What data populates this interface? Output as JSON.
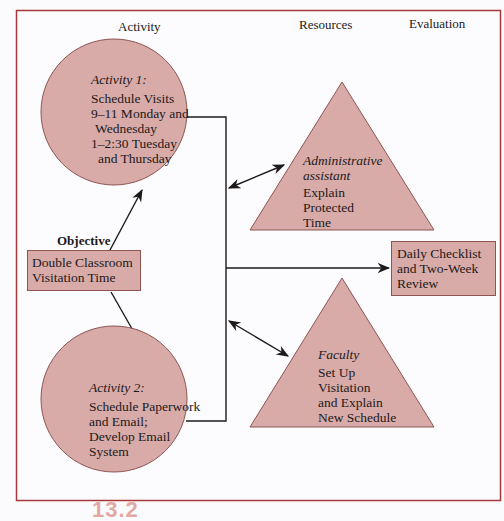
{
  "headers": {
    "activity": "Activity",
    "resources": "Resources",
    "evaluation": "Evaluation"
  },
  "objective": {
    "label": "Objective",
    "text_line1": "Double Classroom",
    "text_line2": "Visitation Time"
  },
  "activity1": {
    "title": "Activity 1:",
    "lines": [
      "Schedule Visits",
      "9–11 Monday and",
      "Wednesday",
      "1–2:30 Tuesday",
      "and Thursday"
    ]
  },
  "activity2": {
    "title": "Activity 2:",
    "lines": [
      "Schedule Paperwork",
      "and Email;",
      "Develop Email",
      "System"
    ]
  },
  "resource1": {
    "title_line1": "Administrative",
    "title_line2": "assistant",
    "lines": [
      "Explain",
      "Protected",
      "Time"
    ]
  },
  "resource2": {
    "title": "Faculty",
    "lines": [
      "Set Up",
      "Visitation",
      "and Explain",
      "New Schedule"
    ]
  },
  "evaluation": {
    "lines": [
      "Daily Checklist",
      "and Two-Week",
      "Review"
    ]
  },
  "figure_number": "13.2",
  "colors": {
    "frame": "#a8393a",
    "shape_fill": "#d8aaa8",
    "shape_stroke": "#8e5452",
    "line": "#1d1a1a"
  }
}
